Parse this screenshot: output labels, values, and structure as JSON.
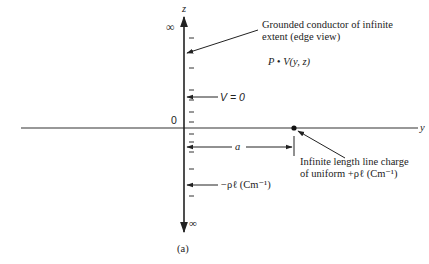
{
  "figure": {
    "caption": "(a)",
    "axes": {
      "z_label": "z",
      "y_label": "y",
      "origin_label": "0",
      "top_infinity": "∞",
      "bottom_infinity": "∞"
    },
    "annotations": {
      "conductor_line1": "Grounded conductor of infinite",
      "conductor_line2": "extent (edge view)",
      "point_label": "P • V(y, z)",
      "potential_label": "V = 0",
      "distance_label": "a",
      "line_charge_line1": "Infinite length line charge",
      "line_charge_line2": "of uniform +ρℓ (Cm⁻¹)",
      "image_charge_label": "−ρℓ (Cm⁻¹)"
    },
    "colors": {
      "ink": "#222222",
      "background": "#ffffff"
    }
  }
}
